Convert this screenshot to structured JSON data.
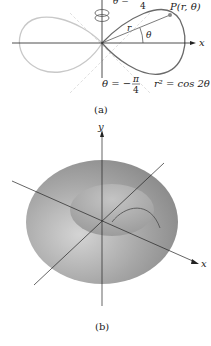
{
  "figure_a": {
    "caption": "(a)",
    "angle_top_label": "θ =",
    "angle_top_den": "4",
    "point_label": "P(r, θ)",
    "r_label": "r",
    "theta_label": "θ",
    "x_axis_label": "x",
    "angle_bottom_lhs": "θ = −",
    "angle_bottom_num": "π",
    "angle_bottom_den": "4",
    "equation": "r² = cos 2θ",
    "icon": "rotation-arrow-icon"
  },
  "figure_b": {
    "caption": "(b)",
    "y_axis_label": "y",
    "x_axis_label": "x"
  },
  "colors": {
    "curve_dark": "#6a6a6a",
    "curve_light": "#c8c8c8",
    "surface": "#9a9a9a",
    "axis": "#222222"
  }
}
